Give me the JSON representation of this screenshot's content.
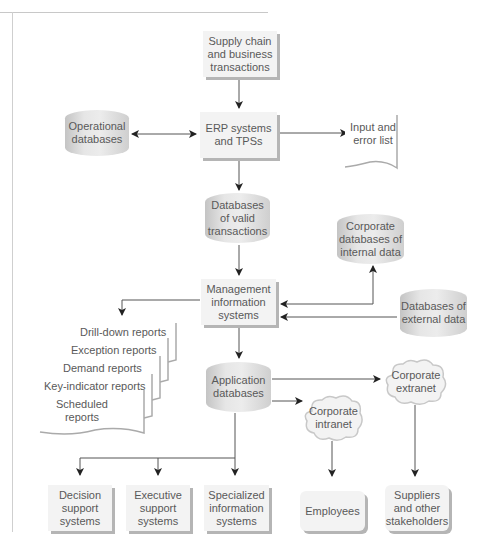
{
  "diagram": {
    "nodes": {
      "supply_chain": "Supply chain\nand business\ntransactions",
      "erp": "ERP systems\nand TPSs",
      "operational_db": "Operational\ndatabases",
      "input_error": "Input and\nerror list",
      "valid_tx_db": "Databases\nof valid\ntransactions",
      "corp_internal_db": "Corporate\ndatabases of\ninternal data",
      "mis": "Management\ninformation\nsystems",
      "external_db": "Databases of\nexternal data",
      "application_db": "Application\ndatabases",
      "corp_extranet": "Corporate\nextranet",
      "corp_intranet": "Corporate\nintranet",
      "decision_support": "Decision\nsupport\nsystems",
      "executive_support": "Executive\nsupport\nsystems",
      "specialized_is": "Specialized\ninformation\nsystems",
      "employees": "Employees",
      "suppliers": "Suppliers\nand other\nstakeholders"
    },
    "reports": [
      "Drill-down reports",
      "Exception reports",
      "Demand reports",
      "Key-indicator reports",
      "Scheduled\nreports"
    ],
    "colors": {
      "box_fill": "#f3f3f3",
      "box_shadow": "#b5b5b5",
      "line": "#555555",
      "text": "#595959"
    }
  }
}
